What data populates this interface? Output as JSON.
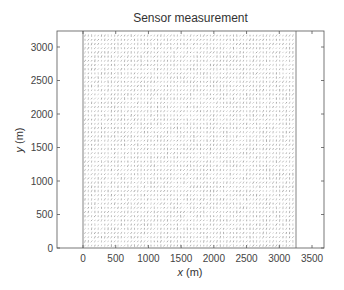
{
  "chart_data": {
    "type": "scatter",
    "title": "Sensor measurement",
    "xlabel": "x (m)",
    "ylabel": "y (m)",
    "xlim": [
      -400,
      3680
    ],
    "ylim": [
      0,
      3240
    ],
    "x_ticks": [
      0,
      500,
      1000,
      1500,
      2000,
      2500,
      3000,
      3500
    ],
    "y_ticks": [
      0,
      500,
      1000,
      1500,
      2000,
      2500,
      3000
    ],
    "x_tick_labels": [
      "0",
      "500",
      "1000",
      "1500",
      "2000",
      "2500",
      "3000",
      "3500"
    ],
    "y_tick_labels": [
      "0",
      "500",
      "1000",
      "1500",
      "2000",
      "2500",
      "3000"
    ],
    "grid": false,
    "legend": null,
    "field": {
      "description": "Dense grid of short slanted dash marks (sensor measurement directions) covering the region",
      "x_range": [
        0,
        3250
      ],
      "y_range": [
        0,
        3200
      ],
      "boundary_lines_x": [
        0,
        3250
      ],
      "mark_color": "#777777"
    }
  },
  "labels": {
    "title": "Sensor measurement",
    "xlabel_var": "x",
    "xlabel_unit": " (m)",
    "ylabel_var": "y",
    "ylabel_unit": " (m)"
  }
}
